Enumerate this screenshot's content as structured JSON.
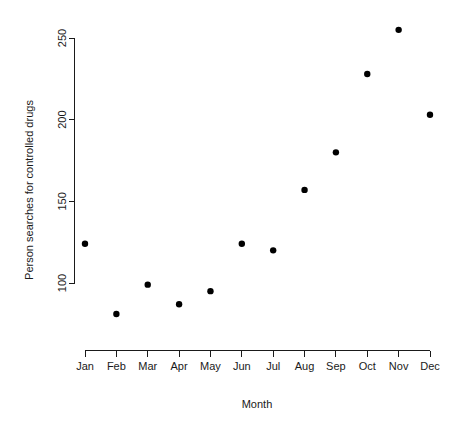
{
  "chart_data": {
    "type": "scatter",
    "title": "",
    "xlabel": "Month",
    "ylabel": "Person searches for controlled drugs",
    "categories": [
      "Jan",
      "Feb",
      "Mar",
      "Apr",
      "May",
      "Jun",
      "Jul",
      "Aug",
      "Sep",
      "Oct",
      "Nov",
      "Dec"
    ],
    "values": [
      124,
      81,
      99,
      87,
      95,
      124,
      120,
      157,
      180,
      228,
      255,
      203
    ],
    "y_ticks": [
      100,
      150,
      200,
      250
    ],
    "y_tick_labels": [
      "100",
      "150",
      "200",
      "250"
    ],
    "x_tick_labels": [
      "Jan",
      "Feb",
      "Mar",
      "Apr",
      "May",
      "Jun",
      "Jul",
      "Aug",
      "Sep",
      "Oct",
      "Nov",
      "Dec"
    ],
    "ylim": [
      100,
      250
    ],
    "xlim": [
      1,
      12
    ],
    "grid": false,
    "legend": null,
    "point_color": "#000000",
    "axis_color": "#1a1a1a",
    "background_color": "#ffffff",
    "point_symbol": "filled-circle"
  },
  "axes": {
    "x_axis_title": "Month",
    "y_axis_title": "Person searches for controlled drugs"
  }
}
